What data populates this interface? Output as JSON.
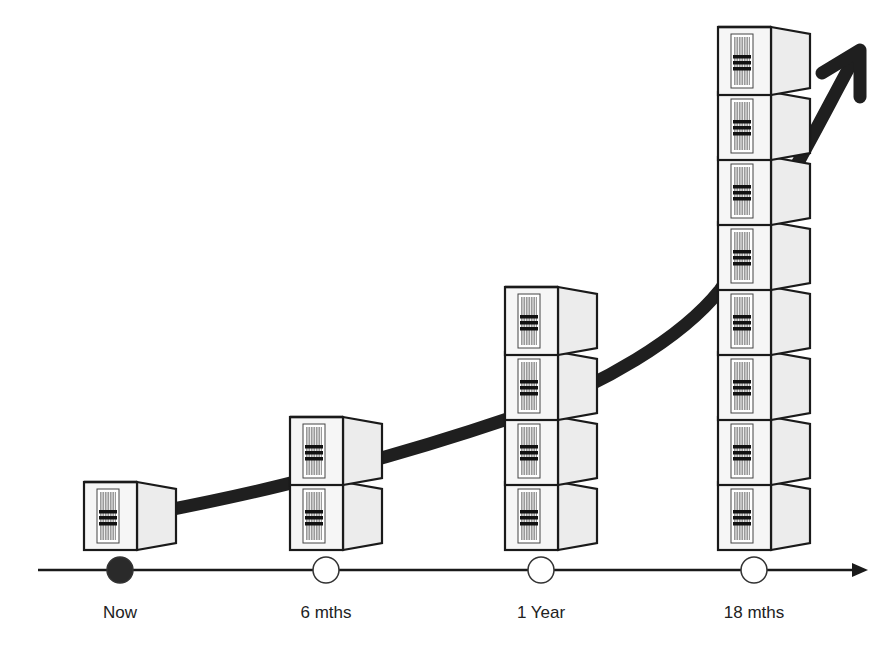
{
  "diagram": {
    "type": "growth-timeline",
    "colors": {
      "line": "#1a1a1a",
      "curve": "#1f1f1f",
      "server_front": "#f6f6f6",
      "server_side": "#ececec",
      "server_outline": "#1a1a1a",
      "grille": "#555555",
      "marker_filled": "#2a2a2a",
      "marker_empty": "#ffffff"
    },
    "milestones": [
      {
        "label": "Now",
        "x": 120,
        "servers": 1,
        "marker": "filled"
      },
      {
        "label": "6 mths",
        "x": 326,
        "servers": 2,
        "marker": "empty"
      },
      {
        "label": "1 Year",
        "x": 541,
        "servers": 4,
        "marker": "empty"
      },
      {
        "label": "18 mths",
        "x": 754,
        "servers": 8,
        "marker": "empty"
      }
    ],
    "axis": {
      "y": 570,
      "x_start": 38,
      "x_end": 868
    },
    "growth_arrow": {
      "direction": "up-right",
      "style": "thick-curve"
    }
  },
  "chart_data": {
    "type": "bar",
    "title": "",
    "categories": [
      "Now",
      "6 mths",
      "1 Year",
      "18 mths"
    ],
    "values": [
      1,
      2,
      4,
      8
    ],
    "xlabel": "",
    "ylabel": "Servers",
    "ylim": [
      0,
      8
    ],
    "annotations": [
      "exponential growth arrow"
    ]
  }
}
